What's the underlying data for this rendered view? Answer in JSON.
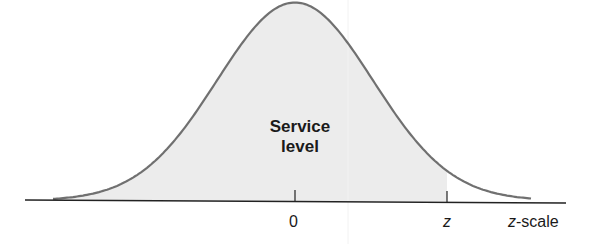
{
  "chart_data": {
    "type": "area",
    "title": "",
    "curve": "normal",
    "mean": 0,
    "shaded_region": {
      "from": "-inf",
      "to": "z",
      "label": "Service level"
    },
    "xlabel": "z-scale",
    "ylabel": "",
    "x_ticks": [
      "0",
      "z"
    ],
    "grid": false,
    "legend": null,
    "colors": {
      "curve": "#6e6e6e",
      "shade": "#ececec",
      "axis": "#222222",
      "text": "#1a1a1a"
    }
  },
  "labels": {
    "area_line1": "Service",
    "area_line2": "level",
    "tick_zero": "0",
    "tick_z": "z",
    "scale_italic": "z",
    "scale_rest": "-scale"
  }
}
